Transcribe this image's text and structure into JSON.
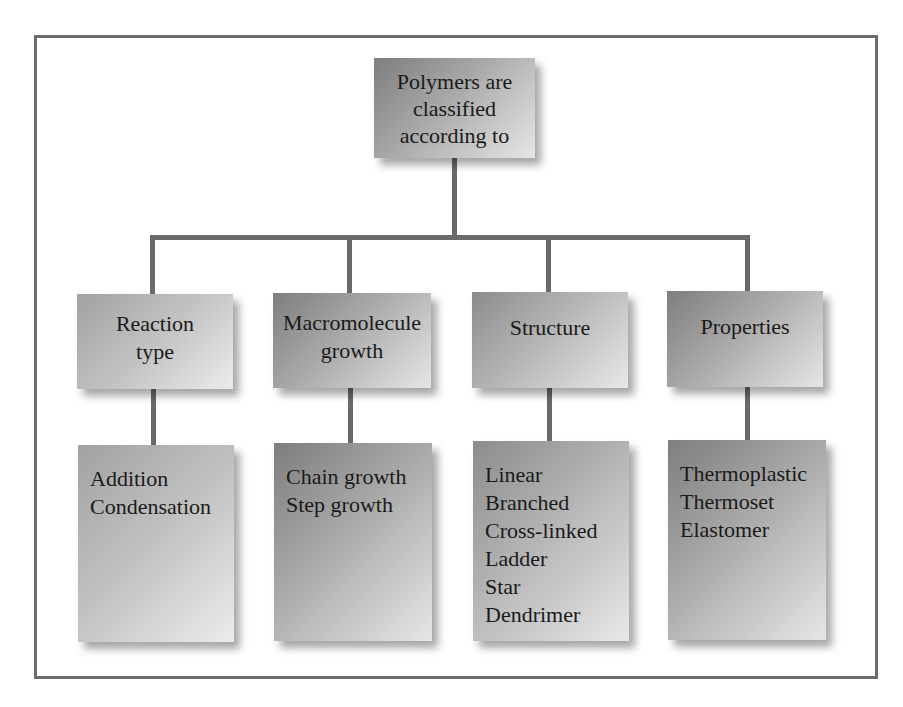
{
  "diagram": {
    "type": "hierarchy-tree",
    "colors": {
      "frame_border": "#6b6b6b",
      "connector": "#6a6a6a",
      "box_gradient_dark": "#8c8c8c",
      "box_gradient_light": "#e8e8e8",
      "text": "#1a1a1a"
    },
    "root": {
      "lines": [
        "Polymers are",
        "classified",
        "according to"
      ]
    },
    "categories": [
      {
        "title_lines": [
          "Reaction",
          "type"
        ],
        "items": [
          "Addition",
          "Condensation"
        ]
      },
      {
        "title_lines": [
          "Macromolecule",
          "growth"
        ],
        "items": [
          "Chain growth",
          "Step growth"
        ]
      },
      {
        "title_lines": [
          "Structure"
        ],
        "items": [
          "Linear",
          "Branched",
          "Cross-linked",
          "Ladder",
          "Star",
          "Dendrimer"
        ]
      },
      {
        "title_lines": [
          "Properties"
        ],
        "items": [
          "Thermoplastic",
          "Thermoset",
          "Elastomer"
        ]
      }
    ]
  }
}
